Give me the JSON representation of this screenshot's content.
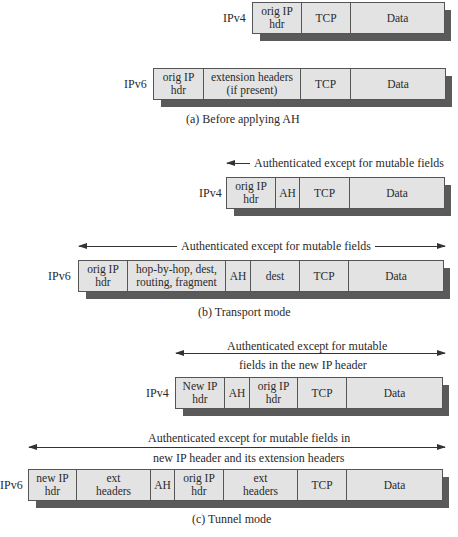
{
  "sections": {
    "a": {
      "caption": "(a) Before applying AH",
      "ipv4": {
        "label": "IPv4",
        "fields": [
          "orig IP\nhdr",
          "TCP",
          "Data"
        ]
      },
      "ipv6": {
        "label": "IPv6",
        "fields": [
          "orig IP\nhdr",
          "extension headers\n(if present)",
          "TCP",
          "Data"
        ]
      }
    },
    "b": {
      "caption": "(b) Transport mode",
      "ipv4": {
        "label": "IPv4",
        "arrow_text": "Authenticated except for mutable fields",
        "fields": [
          "orig IP\nhdr",
          "AH",
          "TCP",
          "Data"
        ]
      },
      "ipv6": {
        "label": "IPv6",
        "arrow_text": "Authenticated except for mutable fields",
        "fields": [
          "orig IP\nhdr",
          "hop-by-hop, dest,\nrouting, fragment",
          "AH",
          "dest",
          "TCP",
          "Data"
        ]
      }
    },
    "c": {
      "caption": "(c) Tunnel mode",
      "ipv4": {
        "label": "IPv4",
        "arrow_text_line1": "Authenticated except for mutable",
        "arrow_text_line2": "fields in the new IP header",
        "fields": [
          "New IP\nhdr",
          "AH",
          "orig IP\nhdr",
          "TCP",
          "Data"
        ]
      },
      "ipv6": {
        "label": "IPv6",
        "arrow_text_line1": "Authenticated except for mutable fields in",
        "arrow_text_line2": "new IP header and its extension headers",
        "fields": [
          "new IP\nhdr",
          "ext\nheaders",
          "AH",
          "orig IP\nhdr",
          "ext\nheaders",
          "TCP",
          "Data"
        ]
      }
    }
  },
  "colors": {
    "cell_fill": "#e3e3e3",
    "shadow": "#5a5a5a",
    "border": "#555555"
  }
}
